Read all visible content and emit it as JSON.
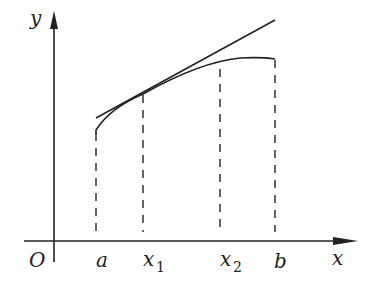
{
  "diagram": {
    "axes": {
      "origin_label": "O",
      "x_label": "x",
      "y_label": "y"
    },
    "tick_labels": {
      "a": "a",
      "x1_base": "x",
      "x1_sub": "1",
      "x2_base": "x",
      "x2_sub": "2",
      "b": "b"
    },
    "elements": {
      "curve": "f(x) concave on [a, b]",
      "tangent_line": "tangent at x1",
      "dashed_lines": [
        "a",
        "x1",
        "x2",
        "b"
      ]
    },
    "colors": {
      "stroke": "#222222",
      "background": "#ffffff"
    }
  }
}
